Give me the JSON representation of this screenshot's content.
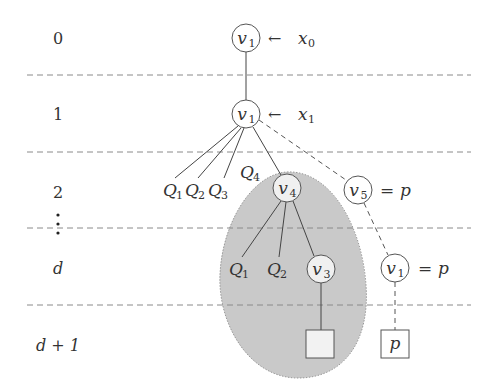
{
  "diagram": {
    "type": "tree-levels",
    "levels": [
      {
        "id": "level-0",
        "label": "0"
      },
      {
        "id": "level-1",
        "label": "1"
      },
      {
        "id": "level-2",
        "label": "2"
      },
      {
        "id": "level-dots",
        "label": "⋮"
      },
      {
        "id": "level-d",
        "label": "d"
      },
      {
        "id": "level-d1",
        "label": "d + 1"
      }
    ],
    "nodes": {
      "root": {
        "name": "v",
        "sub": "1",
        "annotation": "← ",
        "ann_var": "x",
        "ann_sub": "0"
      },
      "level1": {
        "name": "v",
        "sub": "1",
        "annotation": "← ",
        "ann_var": "x",
        "ann_sub": "1"
      },
      "v4": {
        "name": "v",
        "sub": "4"
      },
      "v5": {
        "name": "v",
        "sub": "5",
        "annotation": "= ",
        "ann_var": "p"
      },
      "v3": {
        "name": "v",
        "sub": "3"
      },
      "v1_right": {
        "name": "v",
        "sub": "1",
        "annotation": "= ",
        "ann_var": "p"
      }
    },
    "leaves": {
      "q1_top": {
        "name": "Q",
        "sub": "1"
      },
      "q2_top": {
        "name": "Q",
        "sub": "2"
      },
      "q3_top": {
        "name": "Q",
        "sub": "3"
      },
      "q4_top": {
        "name": "Q",
        "sub": "4"
      },
      "q1_bottom": {
        "name": "Q",
        "sub": "1"
      },
      "q2_bottom": {
        "name": "Q",
        "sub": "2"
      }
    },
    "boxes": {
      "shaded_box": {
        "label": ""
      },
      "p_box": {
        "label": "p"
      }
    },
    "colors": {
      "shaded_region": "#c8c8c8",
      "shaded_box_fill": "#f2f2f2",
      "lines": "#444444",
      "dashed": "#8a8a8a"
    }
  }
}
